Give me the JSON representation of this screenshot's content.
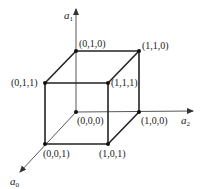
{
  "diagram": {
    "type": "boolean-cube",
    "axes": [
      {
        "name": "a1",
        "base": "a",
        "sub": "1"
      },
      {
        "name": "a2",
        "base": "a",
        "sub": "2"
      },
      {
        "name": "a0",
        "base": "a",
        "sub": "0"
      }
    ],
    "vertices": [
      {
        "id": "v010",
        "label": "(0,1,0)"
      },
      {
        "id": "v110",
        "label": "(1,1,0)"
      },
      {
        "id": "v011",
        "label": "(0,1,1)"
      },
      {
        "id": "v111",
        "label": "(1,1,1)"
      },
      {
        "id": "v000",
        "label": "(0,0,0)"
      },
      {
        "id": "v100",
        "label": "(1,0,0)"
      },
      {
        "id": "v001",
        "label": "(0,0,1)"
      },
      {
        "id": "v101",
        "label": "(1,0,1)"
      }
    ],
    "colors": {
      "edge": "#222222",
      "axis": "#444444",
      "background": "#ffffff"
    }
  }
}
